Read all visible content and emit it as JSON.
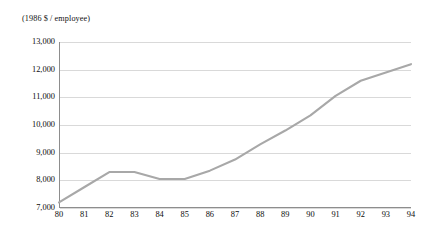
{
  "chart_data": {
    "type": "line",
    "title": "",
    "subtitle": "",
    "unit_caption": "(1986 $ / employee)",
    "xlabel": "",
    "ylabel": "(1986 $ / employee)",
    "categories": [
      "80",
      "81",
      "82",
      "83",
      "84",
      "85",
      "86",
      "87",
      "88",
      "89",
      "90",
      "91",
      "92",
      "93",
      "94"
    ],
    "values": [
      7200,
      7750,
      8300,
      8300,
      8050,
      8050,
      8350,
      8750,
      9300,
      9800,
      10350,
      11050,
      11600,
      11900,
      12200
    ],
    "series": [
      {
        "name": "Real output per employee",
        "values": [
          7200,
          7750,
          8300,
          8300,
          8050,
          8050,
          8350,
          8750,
          9300,
          9800,
          10350,
          11050,
          11600,
          11900,
          12200
        ]
      }
    ],
    "ylim": [
      7000,
      13000
    ],
    "yticks": [
      7000,
      8000,
      9000,
      10000,
      11000,
      12000,
      13000
    ],
    "ytick_labels": [
      "7,000",
      "8,000",
      "9,000",
      "10,000",
      "11,000",
      "12,000",
      "13,000"
    ],
    "xticks": [
      "80",
      "81",
      "82",
      "83",
      "84",
      "85",
      "86",
      "87",
      "88",
      "89",
      "90",
      "91",
      "92",
      "93",
      "94"
    ],
    "grid": "horizontal",
    "legend": "none",
    "colors": {
      "line": "#a8a8a8",
      "grid": "#d9d9d9",
      "axis": "#8d8d8d",
      "text": "#0d0d0d",
      "background": "#ffffff"
    }
  }
}
